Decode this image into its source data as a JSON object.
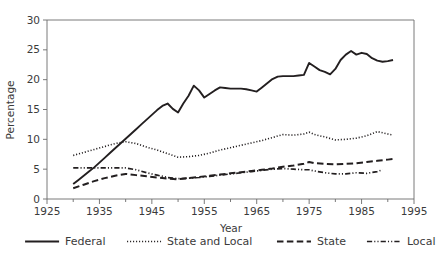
{
  "chart_data": {
    "type": "line",
    "title": "",
    "xlabel": "Year",
    "ylabel": "Percentage",
    "xlim": [
      1925,
      1995
    ],
    "ylim": [
      0,
      30
    ],
    "xticks": [
      1925,
      1935,
      1945,
      1955,
      1965,
      1975,
      1985,
      1995
    ],
    "xtick_labels": [
      "1925",
      "1935",
      "1945",
      "1955",
      "1965",
      "1975",
      "1985",
      "1995"
    ],
    "xminor_ticks": [
      1930,
      1940,
      1950,
      1960,
      1970,
      1980,
      1990
    ],
    "yticks": [
      0,
      5,
      10,
      15,
      20,
      25,
      30
    ],
    "ytick_labels": [
      "0",
      "5",
      "10",
      "15",
      "20",
      "25",
      "30"
    ],
    "grid": false,
    "legend_position": "below",
    "series": [
      {
        "name": "Federal",
        "style": "solid",
        "x": [
          1930,
          1931,
          1932,
          1933,
          1934,
          1935,
          1936,
          1937,
          1938,
          1939,
          1940,
          1941,
          1942,
          1943,
          1944,
          1945,
          1946,
          1947,
          1948,
          1949,
          1950,
          1951,
          1952,
          1953,
          1954,
          1955,
          1956,
          1957,
          1958,
          1959,
          1960,
          1961,
          1962,
          1963,
          1964,
          1965,
          1966,
          1967,
          1968,
          1969,
          1970,
          1971,
          1972,
          1973,
          1974,
          1975,
          1976,
          1977,
          1978,
          1979,
          1980,
          1981,
          1982,
          1983,
          1984,
          1985,
          1986,
          1987,
          1988,
          1989,
          1990,
          1991
        ],
        "values": [
          2.5,
          3.2,
          3.9,
          4.6,
          5.3,
          6.1,
          6.9,
          7.7,
          8.5,
          9.3,
          10.1,
          10.9,
          11.7,
          12.5,
          13.3,
          14.1,
          14.9,
          15.6,
          16.0,
          15.1,
          14.5,
          16.0,
          17.3,
          19.0,
          18.2,
          17.0,
          17.6,
          18.2,
          18.7,
          18.6,
          18.5,
          18.5,
          18.5,
          18.4,
          18.2,
          18.0,
          18.7,
          19.4,
          20.1,
          20.5,
          20.6,
          20.6,
          20.6,
          20.7,
          20.8,
          22.8,
          22.2,
          21.6,
          21.3,
          20.9,
          21.8,
          23.3,
          24.2,
          24.8,
          24.2,
          24.5,
          24.3,
          23.6,
          23.2,
          23.0,
          23.1,
          23.3
        ]
      },
      {
        "name": "State and Local",
        "style": "dotted",
        "x": [
          1930,
          1932,
          1934,
          1936,
          1938,
          1940,
          1942,
          1944,
          1946,
          1948,
          1950,
          1952,
          1954,
          1956,
          1958,
          1960,
          1962,
          1964,
          1966,
          1968,
          1970,
          1972,
          1974,
          1975,
          1976,
          1978,
          1980,
          1982,
          1984,
          1986,
          1988,
          1990,
          1991
        ],
        "values": [
          7.3,
          7.8,
          8.3,
          8.8,
          9.3,
          9.6,
          9.3,
          8.7,
          8.2,
          7.6,
          7.0,
          7.1,
          7.3,
          7.7,
          8.2,
          8.6,
          9.0,
          9.4,
          9.8,
          10.3,
          10.8,
          10.7,
          10.9,
          11.2,
          10.8,
          10.4,
          9.9,
          10.0,
          10.2,
          10.6,
          11.3,
          10.9,
          10.7
        ]
      },
      {
        "name": "State",
        "style": "dashed",
        "x": [
          1930,
          1932,
          1934,
          1936,
          1938,
          1940,
          1942,
          1944,
          1946,
          1948,
          1950,
          1952,
          1954,
          1956,
          1958,
          1960,
          1962,
          1964,
          1966,
          1968,
          1970,
          1972,
          1974,
          1975,
          1976,
          1978,
          1980,
          1982,
          1984,
          1986,
          1988,
          1990,
          1991
        ],
        "values": [
          1.8,
          2.4,
          3.0,
          3.5,
          3.9,
          4.2,
          4.0,
          3.8,
          3.6,
          3.4,
          3.3,
          3.5,
          3.7,
          3.9,
          4.1,
          4.3,
          4.5,
          4.7,
          4.9,
          5.1,
          5.4,
          5.6,
          5.9,
          6.2,
          6.0,
          5.9,
          5.8,
          5.9,
          6.0,
          6.2,
          6.4,
          6.6,
          6.7
        ]
      },
      {
        "name": "Local",
        "style": "dashdot",
        "x": [
          1930,
          1932,
          1934,
          1936,
          1938,
          1940,
          1942,
          1944,
          1946,
          1948,
          1950,
          1952,
          1954,
          1956,
          1958,
          1960,
          1962,
          1964,
          1966,
          1968,
          1970,
          1972,
          1974,
          1975,
          1976,
          1978,
          1980,
          1982,
          1984,
          1986,
          1988,
          1989
        ],
        "values": [
          5.2,
          5.2,
          5.2,
          5.2,
          5.2,
          5.2,
          4.9,
          4.4,
          4.0,
          3.6,
          3.4,
          3.5,
          3.6,
          3.8,
          4.0,
          4.2,
          4.4,
          4.6,
          4.8,
          5.0,
          5.1,
          5.0,
          4.9,
          4.9,
          4.7,
          4.4,
          4.2,
          4.2,
          4.4,
          4.3,
          4.6,
          4.9
        ]
      }
    ]
  },
  "legend": {
    "items": [
      {
        "label": "Federal",
        "style": "solid"
      },
      {
        "label": "State and Local",
        "style": "dotted"
      },
      {
        "label": "State",
        "style": "dashed"
      },
      {
        "label": "Local",
        "style": "dashdot"
      }
    ]
  },
  "colors": {
    "line": "#231f20",
    "axis": "#6b6b6b",
    "text": "#3b3b3b",
    "background": "#ffffff"
  }
}
